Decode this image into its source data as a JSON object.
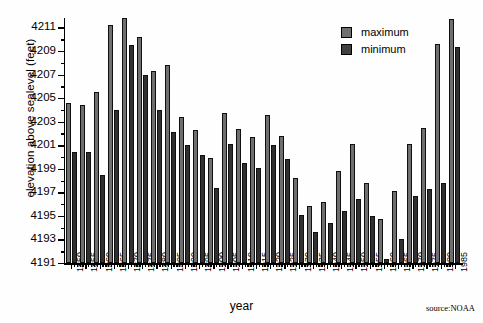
{
  "chart_data": {
    "type": "bar",
    "title": "",
    "xlabel": "year",
    "ylabel": "elevation above sealevel (feet)",
    "ylim": [
      4191,
      4211.8
    ],
    "ytick_step": 2,
    "yticks": [
      4191,
      4193,
      4195,
      4197,
      4199,
      4201,
      4203,
      4205,
      4207,
      4209,
      4211
    ],
    "grid": false,
    "legend_position": "top-right",
    "source": "source:NOAA",
    "xtick_label_step": 5,
    "xtick_labels": [
      1850,
      1855,
      1860,
      1865,
      1870,
      1875,
      1880,
      1885,
      1890,
      1895,
      1900,
      1905,
      1910,
      1915,
      1920,
      1925,
      1930,
      1935,
      1940,
      1945,
      1950,
      1955,
      1960,
      1965,
      1970,
      1975,
      1980,
      1985
    ],
    "categories": [
      1850,
      1855,
      1860,
      1865,
      1870,
      1875,
      1880,
      1885,
      1890,
      1895,
      1900,
      1905,
      1910,
      1915,
      1920,
      1925,
      1930,
      1935,
      1940,
      1945,
      1950,
      1955,
      1960,
      1965,
      1970,
      1975,
      1980,
      1985
    ],
    "series": [
      {
        "name": "maximum",
        "color": "#6f6f6f",
        "values": [
          4204.6,
          4204.4,
          4205.5,
          4211.2,
          4211.8,
          4210.2,
          4207.3,
          4207.8,
          4203.4,
          4202.3,
          4199.9,
          4203.7,
          4202.4,
          4201.7,
          4203.6,
          4201.8,
          4198.2,
          4195.8,
          4196.2,
          4198.8,
          4201.1,
          4197.8,
          4194.7,
          4197.1,
          4201.1,
          4202.5,
          4209.6,
          4211.7
        ]
      },
      {
        "name": "minimum",
        "color": "#303030",
        "values": [
          4200.4,
          4200.4,
          4198.5,
          4204.0,
          4209.5,
          4207.0,
          4204.0,
          4202.1,
          4201.0,
          4200.2,
          4197.4,
          4201.1,
          4199.5,
          4199.1,
          4201.0,
          4199.8,
          4195.1,
          4193.6,
          4194.4,
          4195.4,
          4196.4,
          4195.0,
          4191.3,
          4193.0,
          4196.7,
          4197.3,
          4197.8,
          4209.3
        ]
      }
    ]
  },
  "legend": {
    "items": [
      {
        "label": "maximum"
      },
      {
        "label": "minimum"
      }
    ]
  },
  "axes": {
    "x_title": "year",
    "y_title": "elevation above sealevel (feet)"
  },
  "credit": {
    "text": "source:NOAA"
  }
}
